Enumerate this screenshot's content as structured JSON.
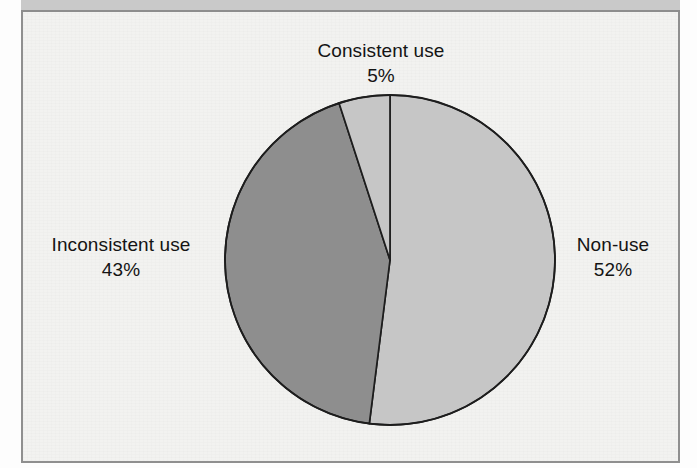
{
  "figure": {
    "frame_border_color": "#8f8f8f",
    "background_color": "#f2f2f0",
    "top_band_color": "#c9c9c9"
  },
  "chart_data": {
    "type": "pie",
    "title": "",
    "subtitle": "",
    "xlabel": "",
    "ylabel": "",
    "grid": false,
    "legend": "none",
    "labels_position": "outside",
    "start_angle_deg": 90,
    "direction": "clockwise",
    "center": {
      "x": 390,
      "y": 260
    },
    "radius": 165,
    "categories": [
      "Non-use",
      "Inconsistent use",
      "Consistent use"
    ],
    "values": [
      52,
      43,
      5
    ],
    "value_unit": "%",
    "slices": [
      {
        "name": "Non-use",
        "value": 52,
        "label": "Non-use",
        "value_label": "52%",
        "color": "#c6c6c6",
        "stroke": "#1d1d1d",
        "start_deg": 0,
        "sweep_deg": 187.2
      },
      {
        "name": "Inconsistent use",
        "value": 43,
        "label": "Inconsistent use",
        "value_label": "43%",
        "color": "#8e8e8e",
        "stroke": "#1d1d1d",
        "start_deg": 187.2,
        "sweep_deg": 154.8
      },
      {
        "name": "Consistent use",
        "value": 5,
        "label": "Consistent use",
        "value_label": "5%",
        "color": "#c6c6c6",
        "stroke": "#1d1d1d",
        "start_deg": 342.0,
        "sweep_deg": 18.0
      }
    ]
  },
  "labels": {
    "consistent": {
      "name": "Consistent use",
      "percent": "5%"
    },
    "nonuse": {
      "name": "Non-use",
      "percent": "52%"
    },
    "inconsistent": {
      "name": "Inconsistent use",
      "percent": "43%"
    }
  },
  "colors": {
    "slice_light": "#c6c6c6",
    "slice_medium": "#8e8e8e",
    "outline": "#1d1d1d",
    "text": "#141414"
  }
}
